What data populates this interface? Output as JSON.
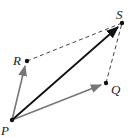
{
  "diagram": {
    "points": [
      {
        "name": "P",
        "x": 12,
        "y": 120,
        "label_x": 1,
        "label_y": 135
      },
      {
        "name": "R",
        "x": 27,
        "y": 61,
        "label_x": 13,
        "label_y": 65
      },
      {
        "name": "Q",
        "x": 106,
        "y": 83,
        "label_x": 111,
        "label_y": 94
      },
      {
        "name": "S",
        "x": 122,
        "y": 23,
        "label_x": 116,
        "label_y": 19
      }
    ],
    "labels": {
      "P": "P",
      "Q": "Q",
      "R": "R",
      "S": "S"
    },
    "colors": {
      "vector": "#777777",
      "resultant": "#111111",
      "dashed": "#444444",
      "point": "#111111"
    }
  }
}
